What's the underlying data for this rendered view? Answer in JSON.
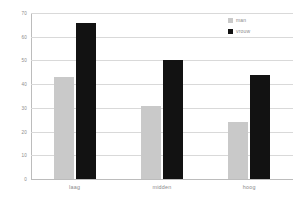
{
  "chart_data": {
    "type": "bar",
    "title": "",
    "subtitle": "",
    "xlabel": "",
    "ylabel": "",
    "categories": [
      "laag",
      "midden",
      "hoog"
    ],
    "series": [
      {
        "name": "man",
        "color": "#c9c9c9",
        "values": [
          43,
          31,
          24
        ]
      },
      {
        "name": "vrouw",
        "color": "#121212",
        "values": [
          66,
          50,
          44
        ]
      }
    ],
    "ylim": [
      0,
      70
    ],
    "ytick_step": 10,
    "yticks": [
      0,
      10,
      20,
      30,
      40,
      50,
      60,
      70
    ],
    "ytick_labels": [
      "0",
      "10",
      "20",
      "30",
      "40",
      "50",
      "60",
      "70"
    ],
    "grid": true,
    "grid_axis": "y",
    "legend": true,
    "legend_position": "top-right",
    "annotations": []
  },
  "colors": {
    "background": "#ffffff",
    "gridline": "#d9d9d9",
    "axis": "#bcbcbc",
    "tick_text": "#8c8c8c",
    "category_text": "#8a8a8a",
    "legend_text": "#8a8a8a",
    "series_man": "#c9c9c9",
    "series_vrouw": "#121212"
  }
}
